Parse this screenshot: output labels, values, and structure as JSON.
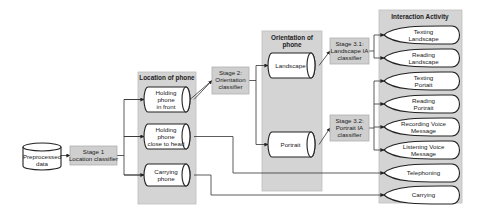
{
  "source": {
    "lines": [
      "Preprocessed",
      "data"
    ]
  },
  "stage1": {
    "lines": [
      "Stage 1",
      "Location classifier"
    ]
  },
  "location_panel": {
    "title": "Location of phone",
    "items": [
      {
        "lines": [
          "Holding",
          "phone",
          "in front"
        ]
      },
      {
        "lines": [
          "Holding",
          "phone",
          "close to head"
        ]
      },
      {
        "lines": [
          "Carrying",
          "phone"
        ]
      }
    ]
  },
  "stage2": {
    "lines": [
      "Stage 2:",
      "Orientation",
      "classifier"
    ]
  },
  "orientation_panel": {
    "title_lines": [
      "Orientation of",
      "phone"
    ],
    "items": [
      {
        "lines": [
          "Landscape"
        ]
      },
      {
        "lines": [
          "Portrait"
        ]
      }
    ]
  },
  "stage31": {
    "lines": [
      "Stage 3.1:",
      "Landscape IA",
      "classifier"
    ]
  },
  "stage32": {
    "lines": [
      "Stage 3.2:",
      "Portrait IA",
      "classifier"
    ]
  },
  "activity_panel": {
    "title": "Interaction Activity",
    "items": [
      {
        "lines": [
          "Texting",
          "Landscape"
        ]
      },
      {
        "lines": [
          "Reading",
          "Landscape"
        ]
      },
      {
        "lines": [
          "Texting",
          "Portait"
        ]
      },
      {
        "lines": [
          "Reading",
          "Portrait"
        ]
      },
      {
        "lines": [
          "Recording Voice",
          "Message"
        ]
      },
      {
        "lines": [
          "Listening Voice",
          "Message"
        ]
      },
      {
        "lines": [
          "Telephoning"
        ]
      },
      {
        "lines": [
          "Carrying"
        ]
      }
    ]
  }
}
